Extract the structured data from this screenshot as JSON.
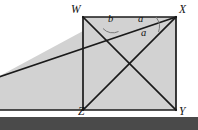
{
  "figure": {
    "name": "rectangle-with-diagonals-and-transversal",
    "canvas": {
      "width": 198,
      "height": 130
    },
    "colors": {
      "page_background": "#ffffff",
      "shaded_fill": "#d2d2d2",
      "stroke": "#1a1a1a",
      "arc_stroke": "#6f6f6f",
      "bottom_bar": "#4a4a4a"
    },
    "vertices": [
      {
        "id": "W",
        "label": "W",
        "x": 83,
        "y": 17,
        "label_x": 71,
        "label_y": 5
      },
      {
        "id": "X",
        "label": "X",
        "x": 176,
        "y": 17,
        "label_x": 179,
        "label_y": 5
      },
      {
        "id": "Y",
        "label": "Y",
        "x": 176,
        "y": 110,
        "label_x": 179,
        "label_y": 108
      },
      {
        "id": "Z",
        "label": "Z",
        "x": 83,
        "y": 110,
        "label_x": 79,
        "label_y": 108
      }
    ],
    "angle_labels": [
      {
        "id": "a-upper",
        "label": "a",
        "x": 140,
        "y": 20
      },
      {
        "id": "a-lower",
        "label": "a",
        "x": 143,
        "y": 33
      },
      {
        "id": "b",
        "label": "b",
        "x": 110,
        "y": 20
      }
    ],
    "segments": [
      {
        "id": "side-WX",
        "from": "W",
        "to": "X"
      },
      {
        "id": "side-XY",
        "from": "X",
        "to": "Y"
      },
      {
        "id": "side-YZ",
        "from": "Y",
        "to": "Z"
      },
      {
        "id": "side-ZW",
        "from": "Z",
        "to": "W"
      },
      {
        "id": "diagonal-WY",
        "from": "W",
        "to": "Y"
      },
      {
        "id": "diagonal-ZX",
        "from": "Z",
        "to": "X"
      },
      {
        "id": "transversal-to-X",
        "from": "left-edge",
        "to": "X"
      },
      {
        "id": "ground-line",
        "from": "left-edge",
        "to": "Y"
      }
    ],
    "bottom_bar": {
      "top": 117,
      "height": 13
    }
  }
}
